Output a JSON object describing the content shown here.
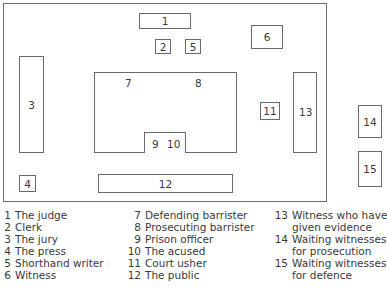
{
  "diagram": {
    "boxes": {
      "b1": "1",
      "b2": "2",
      "b3": "3",
      "b4": "4",
      "b5": "5",
      "b6": "6",
      "b7": "7",
      "b8": "8",
      "b9": "9",
      "b10": "10",
      "b11": "11",
      "b12": "12",
      "b13": "13",
      "b14": "14",
      "b15": "15"
    }
  },
  "legend": {
    "col1": [
      {
        "num": "1",
        "text": "The judge"
      },
      {
        "num": "2",
        "text": "Clerk"
      },
      {
        "num": "3",
        "text": "The jury"
      },
      {
        "num": "4",
        "text": "The press"
      },
      {
        "num": "5",
        "text": "Shorthand writer"
      },
      {
        "num": "6",
        "text": "Witness"
      }
    ],
    "col2": [
      {
        "num": "7",
        "text": "Defending barrister"
      },
      {
        "num": "8",
        "text": "Prosecuting barrister"
      },
      {
        "num": "9",
        "text": "Prison officer"
      },
      {
        "num": "10",
        "text": "The acused"
      },
      {
        "num": "11",
        "text": "Court usher"
      },
      {
        "num": "12",
        "text": "The public"
      }
    ],
    "col3": [
      {
        "num": "13",
        "text": "Witness who have",
        "cont": "given evidence"
      },
      {
        "num": "14",
        "text": "Waiting witnesses",
        "cont": "for prosecution"
      },
      {
        "num": "15",
        "text": "Waiting witnesses",
        "cont": "for defence"
      }
    ]
  }
}
